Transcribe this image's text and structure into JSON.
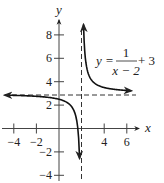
{
  "chart_data": {
    "type": "line",
    "title": "",
    "equation": {
      "lhs": "y =",
      "numerator": "1",
      "denominator": "x − 2",
      "suffix": "+ 3"
    },
    "xlabel": "x",
    "ylabel": "y",
    "xlim": [
      -5,
      7
    ],
    "ylim": [
      -4.5,
      9.5
    ],
    "grid": false,
    "legend": "none",
    "x_ticks": [
      -4,
      -2,
      4,
      6
    ],
    "x_tick_labels": [
      "−4",
      "−2",
      "4",
      "6"
    ],
    "y_ticks": [
      8,
      6,
      4,
      2,
      -2,
      -4
    ],
    "y_tick_labels": [
      "8",
      "6",
      "4",
      "2",
      "−2",
      "−4"
    ],
    "asymptotes": [
      {
        "type": "vertical",
        "x": 2,
        "style": "dashed"
      },
      {
        "type": "horizontal",
        "y": 3,
        "style": "dashed"
      }
    ],
    "series": [
      {
        "name": "left branch",
        "function": "1/(x-2)+3",
        "x": [
          -4.8,
          -4,
          -3,
          -2,
          -1,
          0,
          0.5,
          1,
          1.3,
          1.5,
          1.6,
          1.7,
          1.76
        ],
        "y": [
          2.85,
          2.83,
          2.8,
          2.75,
          2.67,
          2.5,
          2.33,
          2.0,
          1.57,
          1.0,
          0.5,
          -0.33,
          -1.17
        ]
      },
      {
        "name": "right branch",
        "function": "1/(x-2)+3",
        "x": [
          2.12,
          2.15,
          2.2,
          2.3,
          2.5,
          3,
          4,
          5,
          6,
          6.4
        ],
        "y": [
          11.3,
          9.67,
          8.0,
          6.33,
          5.0,
          4.0,
          3.5,
          3.33,
          3.25,
          3.23
        ]
      }
    ]
  }
}
